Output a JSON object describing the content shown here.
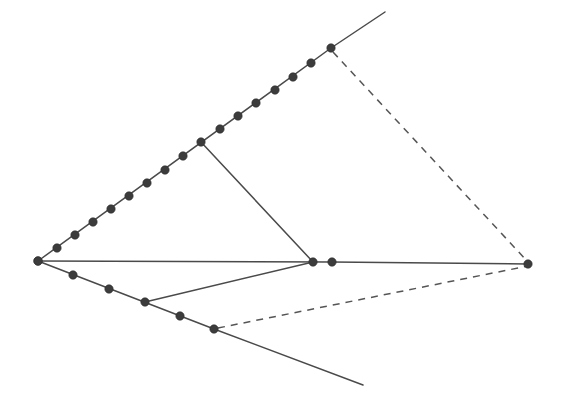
{
  "figure": {
    "type": "line-diagram",
    "canvas": {
      "width": 564,
      "height": 413
    },
    "background_color": "#ffffff",
    "stroke_color": "#4a4a4a",
    "dash_color": "#555555",
    "node_color": "#3c3c3c",
    "node_radius": 4.2,
    "stroke_width": 1.5,
    "dash_pattern": "7 6"
  },
  "vertices": {
    "left_apex": {
      "name": "left-apex",
      "x": 38,
      "y": 261
    },
    "upper_junction": {
      "name": "upper-junction",
      "x": 331,
      "y": 48
    },
    "upper_branch": {
      "name": "upper-branch",
      "x": 201,
      "y": 142
    },
    "center_left_node": {
      "name": "center-left-node",
      "x": 313,
      "y": 262
    },
    "center_right_node": {
      "name": "center-right-node",
      "x": 332,
      "y": 262
    },
    "lower_branch": {
      "name": "lower-branch",
      "x": 145,
      "y": 302
    },
    "lower_junction": {
      "name": "lower-junction",
      "x": 214,
      "y": 329
    },
    "right_vertex": {
      "name": "right-vertex",
      "x": 528,
      "y": 264
    },
    "upper_ray_end": {
      "name": "upper-ray-end",
      "x": 385,
      "y": 12
    },
    "lower_ray_end": {
      "name": "lower-ray-end",
      "x": 363,
      "y": 385
    }
  },
  "edges": [
    {
      "name": "upper-ray-dotted-chain",
      "style": "solid",
      "from": "left_apex",
      "to": "upper_junction",
      "points": "38,261 331,48"
    },
    {
      "name": "upper-ray-extension",
      "style": "solid",
      "from": "upper_junction",
      "to": "upper_ray_end",
      "points": "331,48 385,12"
    },
    {
      "name": "lower-ray-dotted-chain",
      "style": "solid",
      "from": "left_apex",
      "to": "lower_junction",
      "points": "38,261 214,329"
    },
    {
      "name": "lower-ray-extension",
      "style": "solid",
      "from": "lower_junction",
      "to": "lower_ray_end",
      "points": "214,329 363,385"
    },
    {
      "name": "horizontal-axis-left-segment",
      "style": "solid",
      "from": "left_apex",
      "to": "center_right_node",
      "points": "38,261 332,262"
    },
    {
      "name": "horizontal-axis-right-segment",
      "style": "solid",
      "from": "center_right_node",
      "to": "right_vertex",
      "points": "332,262 528,264"
    },
    {
      "name": "upper-branch-to-center",
      "style": "solid",
      "from": "upper_branch",
      "to": "center_left_node",
      "points": "201,142 313,262"
    },
    {
      "name": "lower-branch-to-center",
      "style": "solid",
      "from": "lower_branch",
      "to": "center_left_node",
      "points": "145,302 313,262"
    },
    {
      "name": "upper-dashed-to-right-vertex",
      "style": "dashed",
      "from": "upper_junction",
      "to": "right_vertex",
      "points": "333,52 528,262"
    },
    {
      "name": "lower-dashed-to-right-vertex",
      "style": "dashed",
      "from": "lower_junction",
      "to": "right_vertex",
      "points": "218,328 528,266"
    }
  ],
  "node_chains": {
    "upper_chain": {
      "name": "upper-dot-chain",
      "count": 14,
      "dots": [
        {
          "x": 38,
          "y": 261
        },
        {
          "x": 57,
          "y": 248
        },
        {
          "x": 75,
          "y": 235
        },
        {
          "x": 93,
          "y": 222
        },
        {
          "x": 111,
          "y": 209
        },
        {
          "x": 129,
          "y": 196
        },
        {
          "x": 147,
          "y": 183
        },
        {
          "x": 165,
          "y": 170
        },
        {
          "x": 183,
          "y": 156
        },
        {
          "x": 201,
          "y": 142
        },
        {
          "x": 220,
          "y": 129
        },
        {
          "x": 238,
          "y": 116
        },
        {
          "x": 256,
          "y": 103
        },
        {
          "x": 275,
          "y": 90
        },
        {
          "x": 293,
          "y": 77
        },
        {
          "x": 311,
          "y": 63
        },
        {
          "x": 331,
          "y": 48
        }
      ]
    },
    "lower_chain": {
      "name": "lower-dot-chain",
      "count": 6,
      "dots": [
        {
          "x": 38,
          "y": 261
        },
        {
          "x": 73,
          "y": 275
        },
        {
          "x": 109,
          "y": 289
        },
        {
          "x": 145,
          "y": 302
        },
        {
          "x": 180,
          "y": 316
        },
        {
          "x": 214,
          "y": 329
        }
      ]
    },
    "center_nodes": {
      "name": "center-node-pair",
      "count": 2,
      "dots": [
        {
          "x": 313,
          "y": 262
        },
        {
          "x": 332,
          "y": 262
        }
      ]
    },
    "right_node": {
      "name": "right-vertex-node",
      "count": 1,
      "dots": [
        {
          "x": 528,
          "y": 264
        }
      ]
    }
  }
}
